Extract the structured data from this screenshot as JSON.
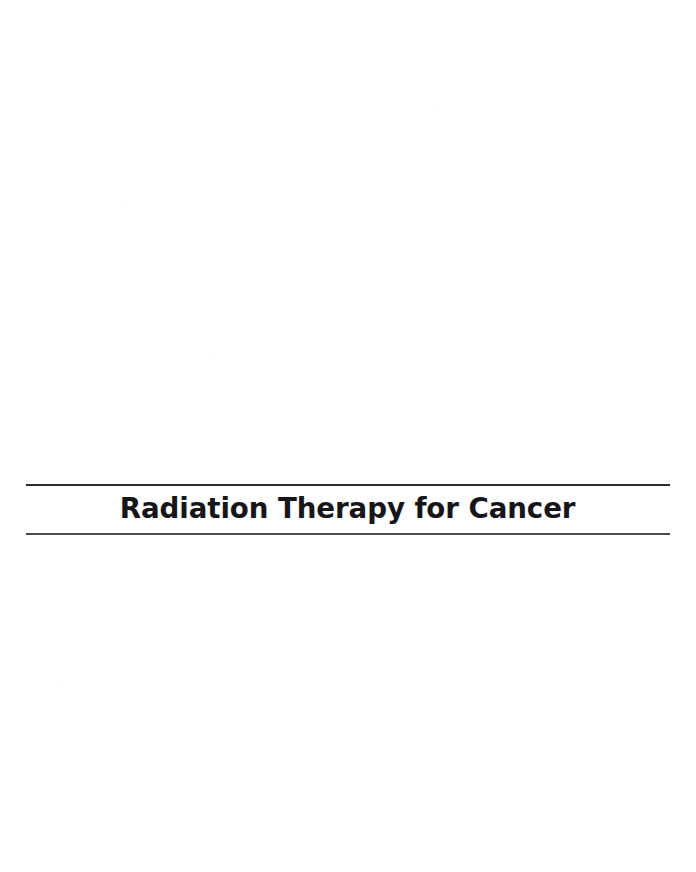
{
  "document": {
    "page_background_color": "#ffffff",
    "page_width": 696,
    "page_height": 872
  },
  "title_block": {
    "chapter_title": "Radiation Therapy for Cancer",
    "title_color": "#16161a",
    "rule_top_color": "#2b2b2b",
    "rule_bottom_color": "#4b4b4b",
    "rule_thickness_px": 2
  }
}
